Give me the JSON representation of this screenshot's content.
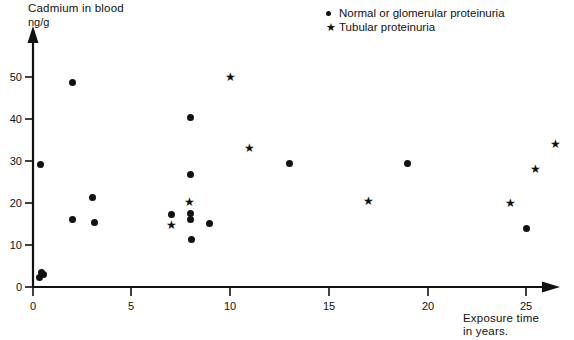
{
  "chart_data": {
    "type": "scatter",
    "title": "",
    "ylabel": "Cadmium in blood",
    "yunit": "ng/g",
    "xlabel_line1": "Exposure time",
    "xlabel_line2": "in years.",
    "xlim": [
      0,
      27
    ],
    "ylim": [
      0,
      56
    ],
    "grid": false,
    "legend_position": "top-right",
    "xticks": [
      "0",
      "5",
      "10",
      "15",
      "20",
      "25"
    ],
    "xtick_values": [
      0,
      5,
      10,
      15,
      20,
      25
    ],
    "yticks": [
      "0",
      "10",
      "20",
      "30",
      "40",
      "50"
    ],
    "ytick_values": [
      0,
      10,
      20,
      30,
      40,
      50
    ],
    "series": [
      {
        "name": "Normal or glomerular proteinuria",
        "marker": "circle",
        "color": "#111111",
        "points": [
          [
            0.35,
            2.3
          ],
          [
            0.55,
            2.9
          ],
          [
            0.45,
            3.5
          ],
          [
            0.4,
            29.2
          ],
          [
            2.0,
            48.7
          ],
          [
            2.0,
            16.0
          ],
          [
            3.0,
            21.3
          ],
          [
            3.1,
            15.3
          ],
          [
            7.0,
            17.2
          ],
          [
            8.0,
            40.4
          ],
          [
            8.0,
            26.8
          ],
          [
            8.0,
            17.6
          ],
          [
            8.0,
            16.0
          ],
          [
            8.05,
            11.2
          ],
          [
            8.95,
            15.2
          ],
          [
            13.0,
            29.5
          ],
          [
            19.0,
            29.4
          ],
          [
            25.0,
            14.0
          ]
        ]
      },
      {
        "name": "Tubular  proteinuria",
        "marker": "star",
        "color": "#111111",
        "points": [
          [
            7.0,
            14.8
          ],
          [
            7.95,
            20.3
          ],
          [
            10.0,
            50.0
          ],
          [
            11.0,
            33.0
          ],
          [
            17.0,
            20.4
          ],
          [
            24.2,
            20.0
          ],
          [
            25.5,
            28.0
          ],
          [
            26.5,
            34.0
          ]
        ]
      }
    ]
  },
  "legend": {
    "items": [
      {
        "marker": "dot",
        "label": "Normal or glomerular proteinuria"
      },
      {
        "marker": "star",
        "label": "Tubular  proteinuria"
      }
    ]
  }
}
